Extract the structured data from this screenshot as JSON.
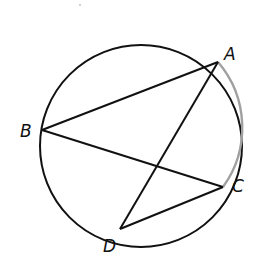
{
  "diagram": {
    "type": "circle-with-chords",
    "circle": {
      "cx": 141,
      "cy": 146,
      "r": 101
    },
    "points": [
      {
        "name": "A",
        "x": 218,
        "y": 62,
        "label_x": 224,
        "label_y": 60
      },
      {
        "name": "B",
        "x": 42,
        "y": 130,
        "label_x": 20,
        "label_y": 137
      },
      {
        "name": "C",
        "x": 223,
        "y": 187,
        "label_x": 232,
        "label_y": 192
      },
      {
        "name": "D",
        "x": 120,
        "y": 229,
        "label_x": 103,
        "label_y": 252
      }
    ],
    "segments": [
      {
        "from": "B",
        "to": "A"
      },
      {
        "from": "B",
        "to": "C"
      },
      {
        "from": "A",
        "to": "D"
      },
      {
        "from": "D",
        "to": "C"
      }
    ],
    "colors": {
      "stroke": "#111111",
      "light_arc": "#9a9a9a"
    }
  }
}
